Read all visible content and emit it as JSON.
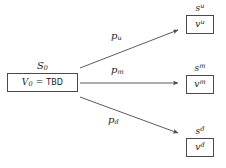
{
  "diagram": {
    "source": {
      "label": "S",
      "label_sub": "0",
      "value_var": "V",
      "value_sub": "0",
      "value_eq": "=",
      "value_text": "TBD"
    },
    "edges": [
      {
        "name": "up",
        "label": "p",
        "label_sub": "u"
      },
      {
        "name": "mid",
        "label": "p",
        "label_sub": "m"
      },
      {
        "name": "down",
        "label": "p",
        "label_sub": "d"
      }
    ],
    "targets": [
      {
        "name": "up",
        "state": "s",
        "state_sup": "u",
        "value": "v",
        "value_sup": "u"
      },
      {
        "name": "mid",
        "state": "s",
        "state_sup": "m",
        "value": "v",
        "value_sup": "m"
      },
      {
        "name": "down",
        "state": "s",
        "state_sup": "d",
        "value": "v",
        "value_sup": "d"
      }
    ],
    "colors": {
      "background": "#ffffff",
      "stroke": "#4a4a4a",
      "text": "#1a1a1a"
    }
  }
}
